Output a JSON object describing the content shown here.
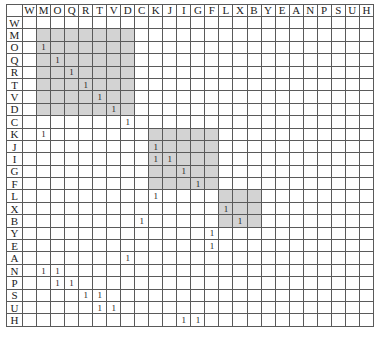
{
  "matrix": {
    "labels": [
      "W",
      "M",
      "O",
      "Q",
      "R",
      "T",
      "V",
      "D",
      "C",
      "K",
      "J",
      "I",
      "G",
      "F",
      "L",
      "X",
      "B",
      "Y",
      "E",
      "A",
      "N",
      "P",
      "S",
      "U",
      "H"
    ],
    "mark": "1",
    "shade_color": "#d3d3d3",
    "shaded_blocks": [
      {
        "rows": [
          "M",
          "O",
          "Q",
          "R",
          "T",
          "V",
          "D"
        ],
        "cols": [
          "M",
          "O",
          "Q",
          "R",
          "T",
          "V",
          "D"
        ]
      },
      {
        "rows": [
          "K",
          "J",
          "I",
          "G",
          "F"
        ],
        "cols": [
          "K",
          "J",
          "I",
          "G",
          "F"
        ]
      },
      {
        "rows": [
          "L",
          "X",
          "B"
        ],
        "cols": [
          "L",
          "X",
          "B"
        ]
      }
    ],
    "rows": [
      {
        "label": "W",
        "marks": []
      },
      {
        "label": "M",
        "marks": []
      },
      {
        "label": "O",
        "marks": [
          "M"
        ]
      },
      {
        "label": "Q",
        "marks": [
          "O"
        ]
      },
      {
        "label": "R",
        "marks": [
          "Q"
        ]
      },
      {
        "label": "T",
        "marks": [
          "R"
        ]
      },
      {
        "label": "V",
        "marks": [
          "T"
        ]
      },
      {
        "label": "D",
        "marks": [
          "V"
        ]
      },
      {
        "label": "C",
        "marks": [
          "D"
        ]
      },
      {
        "label": "K",
        "marks": [
          "M"
        ]
      },
      {
        "label": "J",
        "marks": [
          "K"
        ]
      },
      {
        "label": "I",
        "marks": [
          "K",
          "J"
        ]
      },
      {
        "label": "G",
        "marks": [
          "I"
        ]
      },
      {
        "label": "F",
        "marks": [
          "G"
        ]
      },
      {
        "label": "L",
        "marks": [
          "K"
        ]
      },
      {
        "label": "X",
        "marks": [
          "L"
        ]
      },
      {
        "label": "B",
        "marks": [
          "C",
          "X"
        ]
      },
      {
        "label": "Y",
        "marks": [
          "F"
        ]
      },
      {
        "label": "E",
        "marks": [
          "F"
        ]
      },
      {
        "label": "A",
        "marks": [
          "D"
        ]
      },
      {
        "label": "N",
        "marks": [
          "M",
          "O"
        ]
      },
      {
        "label": "P",
        "marks": [
          "O",
          "Q"
        ]
      },
      {
        "label": "S",
        "marks": [
          "R",
          "T"
        ]
      },
      {
        "label": "U",
        "marks": [
          "T",
          "V"
        ]
      },
      {
        "label": "H",
        "marks": [
          "I",
          "G"
        ]
      }
    ]
  }
}
